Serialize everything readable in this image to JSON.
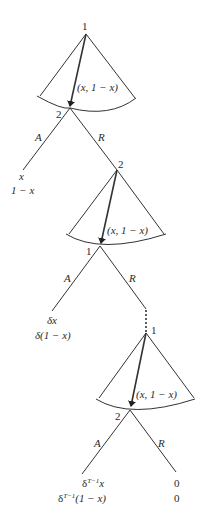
{
  "diagram": {
    "type": "extensive-form game tree (alternating-offer bargaining)",
    "stages": [
      {
        "proposer": "1",
        "responder": "2",
        "offer_label": "(x, 1 − x)",
        "accept_label": "A",
        "reject_label": "R",
        "accept_payoff": [
          "x",
          "1 − x"
        ],
        "next_node": "2"
      },
      {
        "proposer": "2",
        "responder": "1",
        "offer_label": "(x, 1 − x)",
        "accept_label": "A",
        "reject_label": "R",
        "accept_payoff": [
          "δx",
          "δ(1 − x)"
        ],
        "next_node": "1"
      },
      {
        "proposer": "1",
        "responder": "2",
        "offer_label": "(x, 1 − x)",
        "accept_label": "A",
        "reject_label": "R",
        "accept_payoff_base": [
          "δ",
          "δ"
        ],
        "accept_payoff_exp": "T−1",
        "accept_payoff_tail": [
          "x",
          "(1 − x)"
        ],
        "reject_payoff": [
          "0",
          "0"
        ]
      }
    ]
  }
}
